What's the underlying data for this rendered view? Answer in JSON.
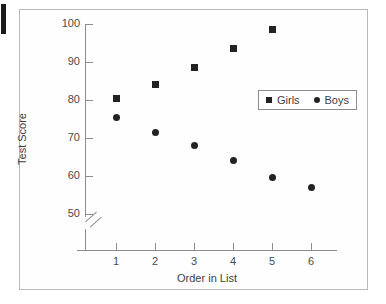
{
  "figure": {
    "background_color": "#ffffff",
    "frame_color": "#b9b9b9",
    "marker_color": "#232323"
  },
  "chart_data": {
    "type": "scatter",
    "title": "",
    "xlabel": "Order in List",
    "ylabel": "Test Score",
    "x": [
      1,
      2,
      3,
      4,
      5,
      6
    ],
    "xticklabels": [
      "1",
      "2",
      "3",
      "4",
      "5",
      "6"
    ],
    "yticks": [
      50,
      60,
      70,
      80,
      90,
      100
    ],
    "yticklabels": [
      "50",
      "60",
      "70",
      "80",
      "90",
      "100"
    ],
    "ylim": [
      50,
      100
    ],
    "xlim": [
      0.5,
      6.5
    ],
    "y_axis_break": true,
    "grid": false,
    "legend_position": "upper right",
    "series": [
      {
        "name": "Girls",
        "marker": "square",
        "points": [
          {
            "x": 1,
            "y": 80.5
          },
          {
            "x": 2,
            "y": 84.0
          },
          {
            "x": 3,
            "y": 88.5
          },
          {
            "x": 4,
            "y": 93.5
          },
          {
            "x": 5,
            "y": 98.5
          }
        ]
      },
      {
        "name": "Boys",
        "marker": "circle",
        "points": [
          {
            "x": 1,
            "y": 75.5
          },
          {
            "x": 2,
            "y": 71.5
          },
          {
            "x": 3,
            "y": 68.0
          },
          {
            "x": 4,
            "y": 64.0
          },
          {
            "x": 5,
            "y": 59.5
          },
          {
            "x": 6,
            "y": 57.0
          }
        ]
      }
    ]
  },
  "legend": {
    "items": [
      {
        "label": "Girls",
        "marker": "square"
      },
      {
        "label": "Boys",
        "marker": "circle"
      }
    ]
  }
}
